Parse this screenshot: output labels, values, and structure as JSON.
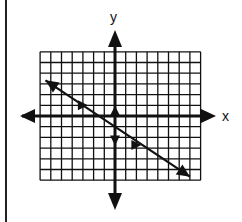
{
  "chart_data": {
    "type": "line",
    "title": "",
    "xlabel": "x",
    "ylabel": "y",
    "xlim": [
      -7,
      8
    ],
    "ylim": [
      -6,
      6
    ],
    "grid": true,
    "grid_step": 1,
    "tick_labels": false,
    "series": [
      {
        "name": "line",
        "equation": "y = -2/3 x - 1",
        "slope": -0.6667,
        "y_intercept": -1,
        "x": [
          -6.5,
          -3,
          0,
          3,
          7
        ],
        "y": [
          3.33,
          1,
          -1,
          -3,
          -5.67
        ],
        "arrowheads": "both ends"
      }
    ],
    "annotations": [
      {
        "type": "slope-triangle-marker",
        "at": [
          -3,
          1
        ],
        "direction": "right"
      },
      {
        "type": "slope-triangle-marker",
        "at": [
          0,
          0.5
        ],
        "direction": "up"
      },
      {
        "type": "slope-triangle-marker",
        "at": [
          0,
          -2.3
        ],
        "direction": "down"
      },
      {
        "type": "slope-triangle-marker",
        "at": [
          2,
          -2.7
        ],
        "direction": "right"
      }
    ]
  },
  "labels": {
    "x_axis": "x",
    "y_axis": "y"
  },
  "colors": {
    "ink": "#111111",
    "background": "#ffffff"
  }
}
